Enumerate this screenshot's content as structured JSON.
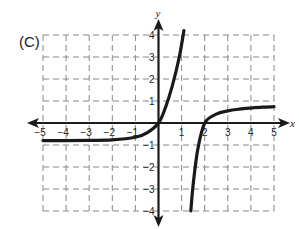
{
  "panel_label": "(C)",
  "chart_data": {
    "type": "line",
    "title": "",
    "xlabel": "x",
    "ylabel": "y",
    "xlim": [
      -5,
      5
    ],
    "ylim": [
      -4,
      4
    ],
    "grid": true,
    "grid_style": "dashed",
    "x_ticks": [
      "-5",
      "-4",
      "-3",
      "-2",
      "-1",
      "1",
      "2",
      "3",
      "4",
      "5"
    ],
    "y_ticks": [
      "4",
      "3",
      "2",
      "1",
      "-1",
      "-2",
      "-3",
      "-4"
    ],
    "annotations": {
      "vertical_asymptote_x": 1.3,
      "horizontal_asymptote_left_y": -0.8,
      "horizontal_asymptote_right_y": 1,
      "x_intercepts": [
        0,
        2
      ],
      "y_intercept": 0
    },
    "series": [
      {
        "name": "left branch",
        "x": [
          -5,
          -4,
          -3,
          -2,
          -1,
          -0.5,
          0,
          0.3,
          0.6,
          0.9,
          1.1
        ],
        "y": [
          -0.8,
          -0.8,
          -0.79,
          -0.77,
          -0.65,
          -0.45,
          0,
          0.7,
          1.7,
          3.0,
          4.2
        ]
      },
      {
        "name": "right branch",
        "x": [
          1.4,
          1.5,
          1.7,
          2.0,
          2.5,
          3,
          3.5,
          4,
          4.5,
          5
        ],
        "y": [
          -4.0,
          -2.8,
          -1.2,
          0,
          0.4,
          0.55,
          0.63,
          0.68,
          0.72,
          0.74
        ]
      }
    ]
  }
}
